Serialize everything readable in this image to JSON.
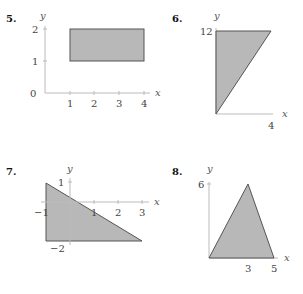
{
  "problems": [
    {
      "number": "5.",
      "x_label": "x",
      "y_label": "y",
      "x_ticks": [
        "1",
        "2",
        "3",
        "4"
      ],
      "y_ticks": [
        "0",
        "1",
        "2"
      ],
      "shape": "rectangle",
      "vertices": [
        [
          1,
          1
        ],
        [
          4,
          1
        ],
        [
          4,
          2
        ],
        [
          1,
          2
        ]
      ]
    },
    {
      "number": "6.",
      "x_label": "x",
      "y_label": "y",
      "x_ticks": [
        "4"
      ],
      "y_ticks": [
        "12"
      ],
      "shape": "triangle",
      "vertices": [
        [
          0,
          0
        ],
        [
          0,
          12
        ],
        [
          4,
          12
        ]
      ]
    },
    {
      "number": "7.",
      "x_label": "x",
      "y_label": "y",
      "x_ticks": [
        "−1",
        "1",
        "2",
        "3"
      ],
      "y_ticks": [
        "1",
        "−2"
      ],
      "shape": "triangle",
      "vertices": [
        [
          -1,
          1
        ],
        [
          -1,
          -2
        ],
        [
          3,
          -2
        ]
      ]
    },
    {
      "number": "8.",
      "x_label": "x",
      "y_label": "y",
      "x_ticks": [
        "3",
        "5"
      ],
      "y_ticks": [
        "6"
      ],
      "shape": "triangle",
      "vertices": [
        [
          0,
          0
        ],
        [
          3,
          6
        ],
        [
          5,
          0
        ]
      ]
    }
  ],
  "colors": {
    "fill": "#b8b8b8",
    "stroke": "#555555",
    "axis": "#bbbbbb"
  }
}
